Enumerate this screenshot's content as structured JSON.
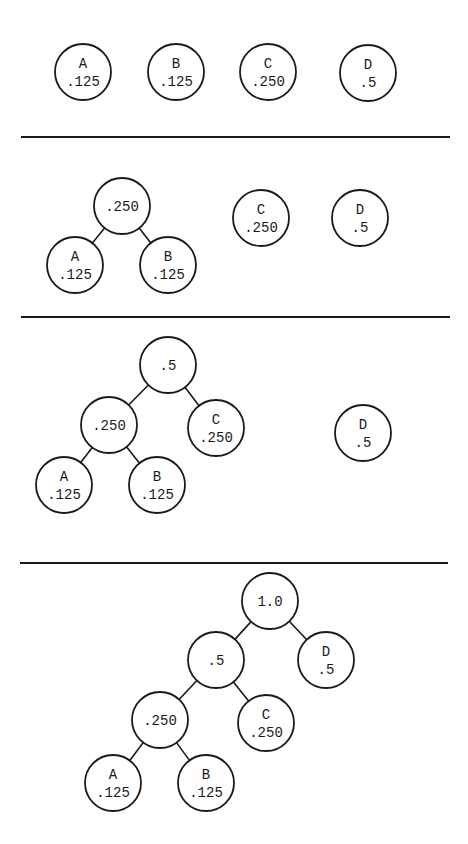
{
  "diagram": {
    "panels": [
      {
        "step": 1,
        "nodes": [
          {
            "id": "A",
            "label": "A",
            "value": ".125",
            "x": 83,
            "y": 72
          },
          {
            "id": "B",
            "label": "B",
            "value": ".125",
            "x": 176,
            "y": 72
          },
          {
            "id": "C",
            "label": "C",
            "value": ".250",
            "x": 268,
            "y": 72
          },
          {
            "id": "D",
            "label": "D",
            "value": ".5",
            "x": 368,
            "y": 73
          }
        ],
        "edges": []
      },
      {
        "step": 2,
        "nodes": [
          {
            "id": "AB",
            "label": "",
            "value": ".250",
            "x": 122,
            "y": 206
          },
          {
            "id": "A",
            "label": "A",
            "value": ".125",
            "x": 75,
            "y": 265
          },
          {
            "id": "B",
            "label": "B",
            "value": ".125",
            "x": 168,
            "y": 265
          },
          {
            "id": "C",
            "label": "C",
            "value": ".250",
            "x": 261,
            "y": 218
          },
          {
            "id": "D",
            "label": "D",
            "value": ".5",
            "x": 360,
            "y": 218
          }
        ],
        "edges": [
          [
            "AB",
            "A"
          ],
          [
            "AB",
            "B"
          ]
        ]
      },
      {
        "step": 3,
        "nodes": [
          {
            "id": "ABC",
            "label": "",
            "value": ".5",
            "x": 168,
            "y": 365
          },
          {
            "id": "AB",
            "label": "",
            "value": ".250",
            "x": 109,
            "y": 425
          },
          {
            "id": "C",
            "label": "C",
            "value": ".250",
            "x": 216,
            "y": 428
          },
          {
            "id": "A",
            "label": "A",
            "value": ".125",
            "x": 64,
            "y": 485
          },
          {
            "id": "B",
            "label": "B",
            "value": ".125",
            "x": 157,
            "y": 485
          },
          {
            "id": "D",
            "label": "D",
            "value": ".5",
            "x": 363,
            "y": 433
          }
        ],
        "edges": [
          [
            "ABC",
            "AB"
          ],
          [
            "ABC",
            "C"
          ],
          [
            "AB",
            "A"
          ],
          [
            "AB",
            "B"
          ]
        ]
      },
      {
        "step": 4,
        "nodes": [
          {
            "id": "ROOT",
            "label": "",
            "value": "1.0",
            "x": 270,
            "y": 601
          },
          {
            "id": "ABC",
            "label": "",
            "value": ".5",
            "x": 216,
            "y": 660
          },
          {
            "id": "D",
            "label": "D",
            "value": ".5",
            "x": 326,
            "y": 660
          },
          {
            "id": "AB",
            "label": "",
            "value": ".250",
            "x": 160,
            "y": 720
          },
          {
            "id": "C",
            "label": "C",
            "value": ".250",
            "x": 266,
            "y": 723
          },
          {
            "id": "A",
            "label": "A",
            "value": ".125",
            "x": 113,
            "y": 783
          },
          {
            "id": "B",
            "label": "B",
            "value": ".125",
            "x": 206,
            "y": 783
          }
        ],
        "edges": [
          [
            "ROOT",
            "ABC"
          ],
          [
            "ROOT",
            "D"
          ],
          [
            "ABC",
            "AB"
          ],
          [
            "ABC",
            "C"
          ],
          [
            "AB",
            "A"
          ],
          [
            "AB",
            "B"
          ]
        ]
      }
    ],
    "dividers": [
      {
        "y": 137,
        "x1": 21,
        "x2": 450
      },
      {
        "y": 317,
        "x1": 21,
        "x2": 450
      },
      {
        "y": 563,
        "x1": 20,
        "x2": 448
      }
    ],
    "node_radius": 28,
    "stroke_color": "#1a1a1a",
    "background": "#ffffff"
  }
}
